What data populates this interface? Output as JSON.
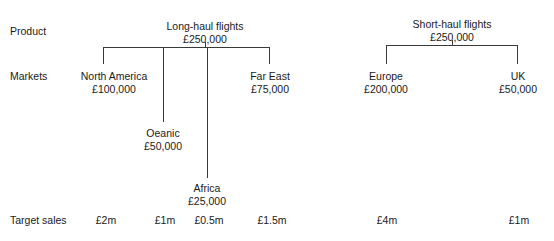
{
  "diagram": {
    "line_color": "#3a3a3a",
    "text_color": "#1a1a1a",
    "background": "#ffffff",
    "currency_symbol": "£"
  },
  "row_labels": [
    {
      "id": "row-product",
      "text": "Product",
      "x": 10,
      "y": 25
    },
    {
      "id": "row-markets",
      "text": "Markets",
      "x": 10,
      "y": 70
    },
    {
      "id": "row-target-sales",
      "text": "Target sales",
      "x": 10,
      "y": 214
    }
  ],
  "nodes": [
    {
      "id": "long-haul-flights",
      "level": "product",
      "name": "Long-haul flights",
      "value": "£250,000",
      "x": 205,
      "y": 20
    },
    {
      "id": "short-haul-flights",
      "level": "product",
      "name": "Short-haul flights",
      "value": "£250,000",
      "x": 452,
      "y": 18
    },
    {
      "id": "north-america",
      "level": "market",
      "parent": "long-haul-flights",
      "name": "North America",
      "value": "£100,000",
      "x": 114,
      "y": 70
    },
    {
      "id": "far-east",
      "level": "market",
      "parent": "long-haul-flights",
      "name": "Far East",
      "value": "£75,000",
      "x": 270,
      "y": 70
    },
    {
      "id": "oeanic",
      "level": "market",
      "parent": "long-haul-flights",
      "name": "Oeanic",
      "value": "£50,000",
      "x": 163,
      "y": 127
    },
    {
      "id": "africa",
      "level": "market",
      "parent": "long-haul-flights",
      "name": "Africa",
      "value": "£25,000",
      "x": 207,
      "y": 182
    },
    {
      "id": "europe",
      "level": "market",
      "parent": "short-haul-flights",
      "name": "Europe",
      "value": "£200,000",
      "x": 386,
      "y": 70
    },
    {
      "id": "uk",
      "level": "market",
      "parent": "short-haul-flights",
      "name": "UK",
      "value": "£50,000",
      "x": 518,
      "y": 70
    }
  ],
  "target_sales": [
    {
      "id": "target-north-america",
      "node": "north-america",
      "text": "£2m",
      "x": 106,
      "y": 214
    },
    {
      "id": "target-oeanic",
      "node": "oeanic",
      "text": "£1m",
      "x": 165,
      "y": 214
    },
    {
      "id": "target-africa",
      "node": "africa",
      "text": "£0.5m",
      "x": 209,
      "y": 214
    },
    {
      "id": "target-far-east",
      "node": "far-east",
      "text": "£1.5m",
      "x": 272,
      "y": 214
    },
    {
      "id": "target-europe",
      "node": "europe",
      "text": "£4m",
      "x": 387,
      "y": 214
    },
    {
      "id": "target-uk",
      "node": "uk",
      "text": "£1m",
      "x": 519,
      "y": 214
    }
  ],
  "connectors": {
    "long_haul": {
      "stem": {
        "x": 205,
        "y1": 42,
        "y2": 47
      },
      "crossbar": {
        "y": 47,
        "x1": 103,
        "x2": 270
      },
      "drops": [
        {
          "id": "drop-north-america",
          "x": 103,
          "y1": 47,
          "y2": 64
        },
        {
          "id": "drop-oeanic",
          "x": 163,
          "y1": 47,
          "y2": 122
        },
        {
          "id": "drop-africa",
          "x": 207,
          "y1": 47,
          "y2": 178
        },
        {
          "id": "drop-far-east",
          "x": 270,
          "y1": 47,
          "y2": 64
        }
      ]
    },
    "short_haul": {
      "stem": {
        "x": 452,
        "y1": 40,
        "y2": 45
      },
      "crossbar": {
        "y": 45,
        "x1": 386,
        "x2": 518
      },
      "drops": [
        {
          "id": "drop-europe",
          "x": 386,
          "y1": 45,
          "y2": 64
        },
        {
          "id": "drop-uk",
          "x": 518,
          "y1": 45,
          "y2": 64
        }
      ]
    }
  }
}
